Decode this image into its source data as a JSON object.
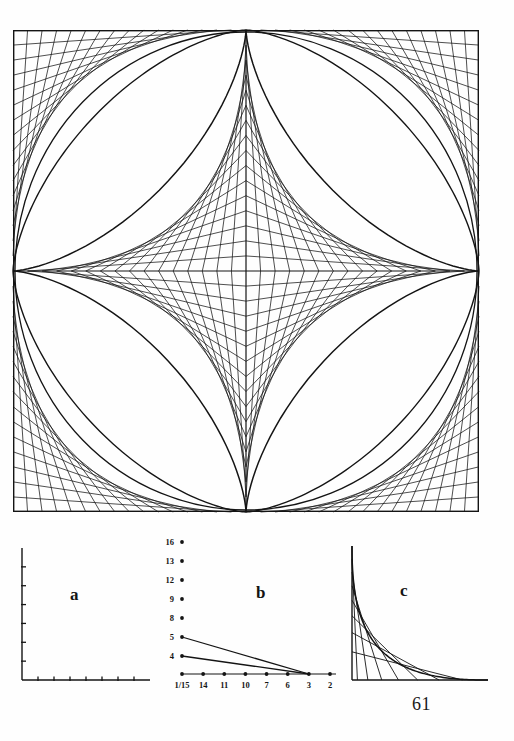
{
  "page": {
    "number": "61",
    "background_color": "#fefefe",
    "ink_color": "#141414"
  },
  "main_figure": {
    "name": "astroid-envelope",
    "description": "Square frame containing an envelope of straight line segments forming a four-cusped astroid in the centre and four circular-arc envelopes in the corners",
    "frame": {
      "x": 0,
      "y": 0,
      "width": 466,
      "height": 482
    },
    "line_count_per_quadrant": 16,
    "axes": {
      "horizontal_at": 241,
      "vertical_at": 233
    }
  },
  "panels": [
    {
      "id": "a",
      "label": "a",
      "label_x": 62,
      "label_y": 60,
      "type": "axes-only",
      "x_axis_ticks": 7,
      "y_axis_ticks": 6,
      "x_tick_labels": [],
      "y_tick_labels": []
    },
    {
      "id": "b",
      "label": "b",
      "label_x": 96,
      "label_y": 64,
      "type": "scatter-lines",
      "y_tick_labels": [
        "16",
        "13",
        "12",
        "9",
        "8",
        "5",
        "4"
      ],
      "x_tick_labels": [
        "1/15",
        "14",
        "11",
        "10",
        "7",
        "6",
        "3",
        "2"
      ],
      "origin_label": "1/15",
      "series": [
        {
          "name": "line-from-5",
          "from_y_label": "5",
          "to_x_label": "3"
        },
        {
          "name": "line-from-4",
          "from_y_label": "4",
          "to_x_label": "3"
        },
        {
          "name": "baseline",
          "from_y_label": "1/15",
          "to_x_label": "2"
        }
      ]
    },
    {
      "id": "c",
      "label": "c",
      "label_x": 62,
      "label_y": 56,
      "type": "hyperbola-envelope",
      "line_count": 7
    }
  ],
  "chart_data": {
    "type": "scatter",
    "title": "",
    "xlabel": "",
    "ylabel": "",
    "panel_b": {
      "y_ticks": [
        16,
        13,
        12,
        9,
        8,
        5,
        4
      ],
      "y_tick_labels": [
        "16",
        "13",
        "12",
        "9",
        "8",
        "5",
        "4"
      ],
      "x_tick_labels": [
        "1/15",
        "14",
        "11",
        "10",
        "7",
        "6",
        "3",
        "2"
      ],
      "points_on_y_axis": [
        "16",
        "13",
        "12",
        "9",
        "8",
        "5",
        "4"
      ],
      "points_on_x_axis": [
        "1/15",
        "14",
        "11",
        "10",
        "7",
        "6",
        "3",
        "2"
      ],
      "lines": [
        {
          "start": [
            "1/15",
            "5"
          ],
          "end": [
            "3",
            "0"
          ]
        },
        {
          "start": [
            "1/15",
            "4"
          ],
          "end": [
            "3",
            "0"
          ]
        }
      ]
    },
    "panel_a": {
      "x_ticks": 7,
      "y_ticks": 6,
      "labels": []
    },
    "panel_c": {
      "curve": "rectangular hyperbola envelope",
      "tangent_lines": 7
    }
  }
}
